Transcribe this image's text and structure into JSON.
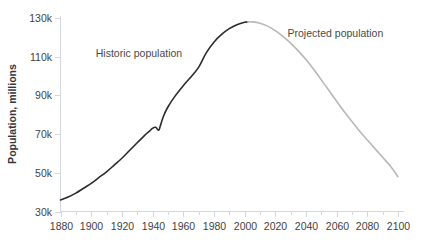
{
  "chart_data": {
    "type": "line",
    "title": "",
    "xlabel": "",
    "ylabel": "Population, millions",
    "xlim": [
      1880,
      2100
    ],
    "ylim": [
      30,
      130
    ],
    "grid": false,
    "legend_position": "inline-annotations",
    "y_tick_labels": [
      "30k",
      "50k",
      "70k",
      "90k",
      "110k",
      "130k"
    ],
    "y_tick_values": [
      30,
      50,
      70,
      90,
      110,
      130
    ],
    "x_tick_labels": [
      "1880",
      "1900",
      "1920",
      "1940",
      "1960",
      "1980",
      "2000",
      "2020",
      "2040",
      "2060",
      "2080",
      "2100"
    ],
    "x_tick_values": [
      1880,
      1900,
      1920,
      1940,
      1960,
      1980,
      2000,
      2020,
      2040,
      2060,
      2080,
      2100
    ],
    "x_minor_tick_values": [
      1890,
      1910,
      1930,
      1950,
      1970,
      1990,
      2010,
      2030,
      2050,
      2070,
      2090
    ],
    "annotations": [
      {
        "text": "Historic population",
        "x": 1903,
        "y": 110,
        "color": "#4a4a4a"
      },
      {
        "text": "Projected population",
        "x": 2028,
        "y": 120,
        "color": "#4a4a4a"
      }
    ],
    "series": [
      {
        "name": "Historic population",
        "color": "#2b2b2b",
        "x": [
          1880,
          1885,
          1890,
          1895,
          1900,
          1905,
          1910,
          1915,
          1920,
          1925,
          1930,
          1935,
          1938,
          1940,
          1942,
          1944,
          1945,
          1947,
          1950,
          1955,
          1960,
          1965,
          1970,
          1975,
          1980,
          1985,
          1990,
          1995,
          2000,
          2002
        ],
        "y": [
          36,
          37.5,
          39.5,
          42,
          44.5,
          47.5,
          50.5,
          54,
          57.5,
          61.5,
          65.5,
          69.5,
          71.5,
          73,
          73.5,
          72,
          74,
          79,
          84,
          90,
          95,
          99.5,
          104.5,
          112,
          117.5,
          121.5,
          124.5,
          126.5,
          127.8,
          128
        ]
      },
      {
        "name": "Projected population",
        "color": "#b6b8bb",
        "x": [
          2002,
          2005,
          2010,
          2015,
          2020,
          2025,
          2030,
          2035,
          2040,
          2045,
          2050,
          2055,
          2060,
          2065,
          2070,
          2075,
          2080,
          2085,
          2090,
          2095,
          2100
        ],
        "y": [
          128,
          128,
          127.3,
          125.8,
          123.5,
          120.5,
          117,
          113,
          108.5,
          103.5,
          98,
          92.5,
          87,
          81.5,
          76.5,
          71.5,
          67,
          62.5,
          58,
          53.5,
          48
        ]
      }
    ]
  },
  "axes": {
    "y_title": "Population, millions"
  }
}
